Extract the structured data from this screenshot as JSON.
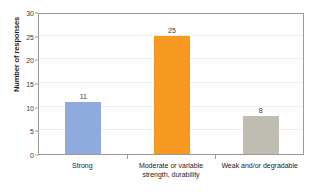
{
  "chart_data": {
    "type": "bar",
    "title": "",
    "subtitle": "",
    "xlabel": "",
    "ylabel": "Number of responses",
    "categories": [
      "Strong",
      "Moderate or variable strength, durability",
      "Weak and/or degradable"
    ],
    "category_lines": [
      [
        "Strong"
      ],
      [
        "Moderate or variable",
        "strength, durability"
      ],
      [
        "Weak and/or degradable"
      ]
    ],
    "values": [
      11,
      25,
      8
    ],
    "value_labels": [
      "11",
      "25",
      "8"
    ],
    "colors": [
      "#8FAADC",
      "#F79820",
      "#BFBCB2"
    ],
    "ylim": [
      0,
      30
    ],
    "yticks": [
      0,
      5,
      10,
      15,
      20,
      25,
      30
    ],
    "ytick_labels": [
      "0",
      "5",
      "10",
      "15",
      "20",
      "25",
      "30"
    ],
    "grid": true,
    "legend": false,
    "legend_position": "none",
    "axis_color": "#9a9a9a",
    "grid_color": "#eeeeee",
    "background": "#ffffff"
  }
}
